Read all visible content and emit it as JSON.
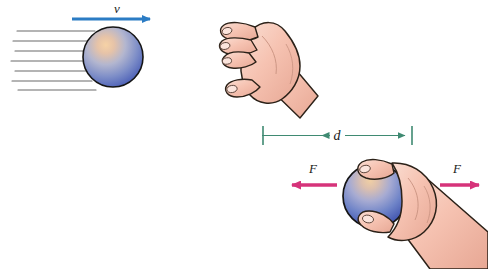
{
  "figure": {
    "background_color": "#ffffff",
    "width": 488,
    "height": 269
  },
  "colors": {
    "velocity_arrow": "#2b7cc4",
    "force_arrow": "#d6337a",
    "dimension_arrow": "#3f8a72",
    "streamline": "#6b6b6b",
    "ball_highlight": "#f2c79a",
    "ball_mid": "#8f9ec9",
    "ball_deep": "#3a55b0",
    "ball_outline": "#1a1a1a",
    "skin_fill": "#f6c3b2",
    "skin_shade": "#e8a894",
    "skin_outline": "#2b2118",
    "nail_fill": "#fbe4dc"
  },
  "panels": {
    "incoming": {
      "name": "ball-in-flight",
      "velocity_label": "v",
      "streamline_count": 7,
      "ball": {
        "cx": 113,
        "cy": 57,
        "r": 30
      }
    },
    "catching_hand": {
      "name": "open-catching-hand",
      "caption": ""
    },
    "grip": {
      "name": "hand-gripping-ball",
      "ball": {
        "cx": 375,
        "cy": 196,
        "r": 32
      },
      "force_left_label": "F",
      "force_right_label": "F"
    },
    "dimension": {
      "name": "stopping-distance",
      "label": "d",
      "x_start": 263,
      "x_end": 412,
      "y": 135
    }
  },
  "labels": {
    "velocity": "v",
    "distance": "d",
    "force_left": "F",
    "force_right": "F"
  }
}
